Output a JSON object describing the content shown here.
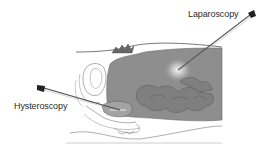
{
  "diagram": {
    "labels": {
      "laparoscopy": "Laparoscopy",
      "hysteroscopy": "Hysteroscopy"
    },
    "colors": {
      "abdominal_cavity": "#8c8c8c",
      "organ_outline": "#6a6a6a",
      "instrument": "#444444",
      "background": "#ffffff"
    }
  }
}
